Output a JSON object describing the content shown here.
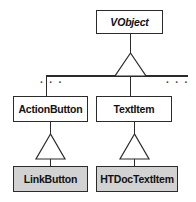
{
  "diagram": {
    "type": "uml-class-inheritance",
    "background_color": "#ffffff",
    "line_color": "#2b2b2b",
    "fill_concrete_color": "#d2d2d2",
    "fill_abstract_color": "#ffffff"
  },
  "nodes": {
    "root": {
      "label": "VObject",
      "style": "abstract",
      "x": 96,
      "y": 10,
      "w": 67,
      "h": 24
    },
    "action_button": {
      "label": "ActionButton",
      "style": "plain",
      "x": 13,
      "y": 96,
      "w": 75,
      "h": 26
    },
    "text_item": {
      "label": "TextItem",
      "style": "plain",
      "x": 96,
      "y": 96,
      "w": 76,
      "h": 26
    },
    "link_button": {
      "label": "LinkButton",
      "style": "filled",
      "x": 13,
      "y": 166,
      "w": 75,
      "h": 26
    },
    "htdoc_text_item": {
      "label": "HTDocTextItem",
      "style": "filled",
      "x": 96,
      "y": 166,
      "w": 82,
      "h": 26
    }
  },
  "ellipses": {
    "left": {
      "label": "· · ·",
      "x": 40,
      "y": 78
    },
    "right": {
      "label": "· · ·",
      "x": 166,
      "y": 78
    }
  },
  "edges": [
    {
      "name": "vobject-to-bus",
      "from": "root",
      "to": "generalization-bus",
      "kind": "generalization"
    },
    {
      "name": "bus-to-action-button",
      "from": "generalization-bus",
      "to": "action_button",
      "kind": "branch"
    },
    {
      "name": "bus-to-text-item",
      "from": "generalization-bus",
      "to": "text_item",
      "kind": "branch"
    },
    {
      "name": "action-button-to-link-button",
      "from": "link_button",
      "to": "action_button",
      "kind": "generalization"
    },
    {
      "name": "text-item-to-htdoc-text-item",
      "from": "htdoc_text_item",
      "to": "text_item",
      "kind": "generalization"
    }
  ]
}
